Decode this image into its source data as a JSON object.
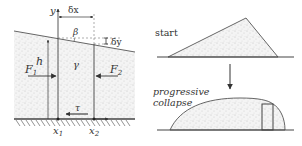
{
  "left_panel": {
    "axis_y": "y",
    "delta_x": "δx",
    "delta_y": "δy",
    "angle": "β",
    "height": "h",
    "force_left": "F",
    "force_left_sub": "1",
    "force_right": "F",
    "force_right_sub": "2",
    "unit_weight": "γ",
    "shear": "τ",
    "x1": "x",
    "x1_sub": "1",
    "x2": "x",
    "x2_sub": "2"
  },
  "right_panel": {
    "start_label": "start",
    "collapse_label_1": "progressive",
    "collapse_label_2": "collapse"
  },
  "colors": {
    "line": "#444444",
    "fill_stipple": "#f2f2f2",
    "dots": "#9a9a9a"
  }
}
